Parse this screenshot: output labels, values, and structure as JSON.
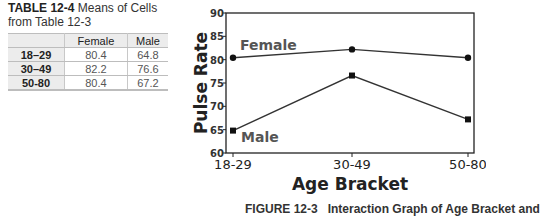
{
  "table": {
    "title_bold": "TABLE 12-4",
    "title_rest": " Means of Cells from Table 12-3",
    "headers": [
      "",
      "Female",
      "Male"
    ],
    "rows": [
      {
        "label": "18–29",
        "female": "80.4",
        "male": "64.8"
      },
      {
        "label": "30–49",
        "female": "82.2",
        "male": "76.6"
      },
      {
        "label": "50-80",
        "female": "80.4",
        "male": "67.2"
      }
    ]
  },
  "caption": {
    "figure": "FIGURE 12-3",
    "text": "Interaction Graph of Age Bracket and"
  },
  "chart_data": {
    "type": "line",
    "title": "",
    "xlabel": "Age Bracket",
    "ylabel": "Pulse Rate",
    "categories": [
      "18-29",
      "30-49",
      "50-80"
    ],
    "series": [
      {
        "name": "Female",
        "marker": "circle",
        "values": [
          80.4,
          82.2,
          80.4
        ]
      },
      {
        "name": "Male",
        "marker": "square",
        "values": [
          64.8,
          76.6,
          67.2
        ]
      }
    ],
    "ylim": [
      60,
      90
    ],
    "yticks": [
      60,
      65,
      70,
      75,
      80,
      85,
      90
    ],
    "grid": false,
    "legend": "inline labels near lines",
    "colors": {
      "line": "#333333",
      "label": "#555555",
      "axis": "#222222"
    }
  }
}
